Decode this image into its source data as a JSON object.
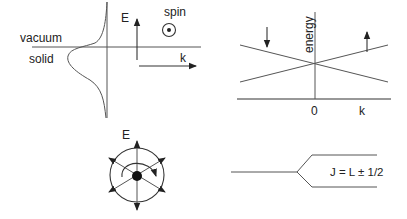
{
  "panels": {
    "surface": {
      "label_vacuum": "vacuum",
      "label_solid": "solid",
      "axis_energy": "E",
      "axis_k": "k",
      "spin_label": "spin",
      "spin_symbol": "out-of-plane-dot"
    },
    "dispersion": {
      "axis_energy": "energy",
      "tick_zero": "0",
      "axis_k": "k",
      "spin_down": "down-arrow",
      "spin_up": "up-arrow"
    },
    "field": {
      "axis_energy": "E"
    },
    "splitting": {
      "formula": "J = L ± 1/2"
    }
  },
  "colors": {
    "line": "#555555",
    "text": "#222222",
    "background": "#ffffff"
  }
}
